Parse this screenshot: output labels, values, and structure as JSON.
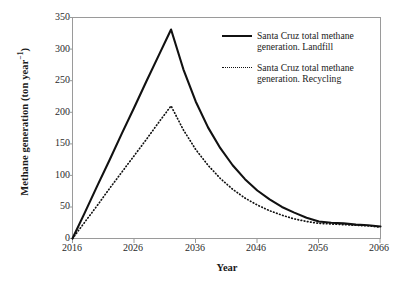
{
  "chart_data": {
    "type": "line",
    "title": "",
    "xlabel": "Year",
    "ylabel": "Methane generation (ton year",
    "ylabel_sup": "−1",
    "ylabel_close": ")",
    "xlim": [
      2016,
      2066
    ],
    "ylim": [
      0,
      350
    ],
    "xticks": [
      2016,
      2026,
      2036,
      2046,
      2056,
      2066
    ],
    "yticks": [
      0,
      50,
      100,
      150,
      200,
      250,
      300,
      350
    ],
    "grid": false,
    "legend_position": "upper-right-inside",
    "x": [
      2016,
      2018,
      2020,
      2022,
      2024,
      2026,
      2028,
      2030,
      2032,
      2034,
      2036,
      2038,
      2040,
      2042,
      2044,
      2046,
      2048,
      2050,
      2052,
      2054,
      2056,
      2058,
      2060,
      2062,
      2064,
      2066
    ],
    "series": [
      {
        "name": "Santa Cruz total methane generation. Landfill",
        "style": "solid",
        "color": "#111111",
        "values": [
          0,
          41,
          83,
          124,
          166,
          207,
          249,
          290,
          331,
          268,
          217,
          176,
          143,
          116,
          94,
          76,
          62,
          50,
          41,
          33,
          27,
          25,
          24,
          22,
          21,
          19
        ]
      },
      {
        "name": "Santa Cruz total methane generation. Recycling",
        "style": "dotted",
        "color": "#111111",
        "values": [
          0,
          26,
          52,
          79,
          105,
          131,
          157,
          184,
          210,
          172,
          141,
          116,
          95,
          78,
          64,
          53,
          44,
          37,
          31,
          27,
          24,
          23,
          22,
          21,
          20,
          18
        ]
      }
    ],
    "peak_year": 2032,
    "peak_values": {
      "landfill": 331,
      "recycling": 210
    }
  },
  "legend": {
    "items": [
      {
        "label_line1": "Santa Cruz total methane",
        "label_line2": "generation. Landfill",
        "style": "solid"
      },
      {
        "label_line1": "Santa Cruz total methane",
        "label_line2": "generation. Recycling",
        "style": "dotted"
      }
    ]
  },
  "axes": {
    "y_title_main": "Methane generation (ton year",
    "y_title_sup": "−1",
    "y_title_end": ")",
    "x_title": "Year",
    "ytick_labels": [
      "350",
      "300",
      "250",
      "200",
      "150",
      "100",
      "50",
      "0"
    ],
    "xtick_labels": [
      "2016",
      "2026",
      "2036",
      "2046",
      "2056",
      "2066"
    ]
  }
}
